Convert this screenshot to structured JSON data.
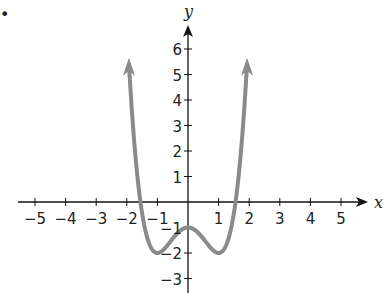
{
  "bullet": "•",
  "chart_data": {
    "type": "line",
    "title": "",
    "function": "y = x^4 - 2x^2 - 1",
    "xlabel": "x",
    "ylabel": "y",
    "xlim": [
      -5,
      5
    ],
    "ylim": [
      -3,
      6
    ],
    "grid": false,
    "x_ticks": [
      -5,
      -4,
      -3,
      -2,
      -1,
      1,
      2,
      3,
      4,
      5
    ],
    "y_ticks": [
      -3,
      -2,
      -1,
      1,
      2,
      3,
      4,
      5,
      6
    ],
    "x_tick_labels": [
      "−5",
      "−4",
      "−3",
      "−2",
      "−1",
      "1",
      "2",
      "3",
      "4",
      "5"
    ],
    "y_tick_labels": [
      "−3",
      "−2",
      "−1",
      "1",
      "2",
      "3",
      "4",
      "5",
      "6"
    ],
    "key_points": [
      {
        "x": -1,
        "y": -2,
        "note": "local minimum"
      },
      {
        "x": 0,
        "y": -1,
        "note": "local maximum"
      },
      {
        "x": 1,
        "y": -2,
        "note": "local minimum"
      }
    ],
    "series": [
      {
        "name": "f(x)",
        "color": "#8a8a8a",
        "x_range": [
          -1.9,
          1.9
        ],
        "arrows_at_ends": true
      }
    ]
  }
}
